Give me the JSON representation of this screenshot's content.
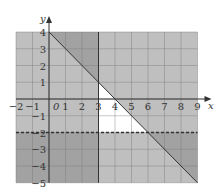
{
  "chart_data": {
    "type": "region-inequality",
    "title": "",
    "xlabel": "x",
    "ylabel": "y",
    "xlim": [
      -2,
      9
    ],
    "ylim": [
      -5,
      4
    ],
    "origin_label": "0",
    "grid": true,
    "x_ticks": [
      "−2",
      "−1",
      "1",
      "2",
      "3",
      "4",
      "5",
      "6",
      "7",
      "8",
      "9"
    ],
    "x_tick_values": [
      -2,
      -1,
      1,
      2,
      3,
      4,
      5,
      6,
      7,
      8,
      9
    ],
    "y_ticks": [
      "4",
      "3",
      "2",
      "1",
      "−1",
      "−2",
      "−3",
      "−4",
      "−5"
    ],
    "y_tick_values": [
      4,
      3,
      2,
      1,
      -1,
      -2,
      -3,
      -4,
      -5
    ],
    "boundaries": [
      {
        "name": "x = 3",
        "type": "vertical",
        "x": 3,
        "style": "solid",
        "shade": "left"
      },
      {
        "name": "y = 4 − x",
        "type": "line",
        "slope": -1,
        "intercept": 4,
        "style": "solid",
        "shade": "above"
      },
      {
        "name": "y = −2",
        "type": "horizontal",
        "y": -2,
        "style": "dashed",
        "shade": "below"
      }
    ],
    "unshaded_region": "x ≥ 3, y > −2, y ≤ 4 − x",
    "colors": {
      "shade": "#8a8a8a",
      "shade_opacity": 0.55,
      "grid": "#7a7a7a",
      "line": "#333333",
      "background": "#ffffff"
    }
  }
}
